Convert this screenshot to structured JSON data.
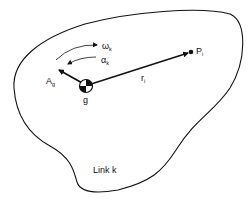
{
  "diagram": {
    "type": "rigid-body-link",
    "link_label": "Link k",
    "center_of_gravity": {
      "label": "g",
      "icon": "center-of-mass-symbol"
    },
    "point": {
      "label": "P",
      "subscript": "i"
    },
    "position_vector": {
      "label": "r",
      "subscript": "i"
    },
    "acceleration_vector": {
      "label": "A",
      "subscript": "g"
    },
    "angular_velocity": {
      "label": "ω",
      "subscript": "k"
    },
    "angular_acceleration": {
      "label": "α",
      "subscript": "k"
    }
  },
  "colors": {
    "stroke": "#111111",
    "background": "#ffffff"
  }
}
